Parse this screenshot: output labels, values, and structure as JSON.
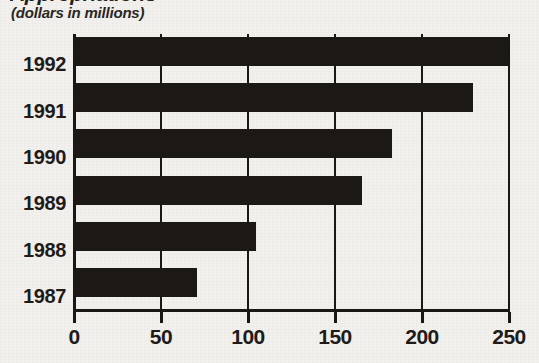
{
  "figure": {
    "title_cropped": "Appropriations",
    "subtitle": "(dollars in millions)"
  },
  "chart_data": {
    "type": "bar",
    "orientation": "horizontal",
    "title": "",
    "subtitle": "(dollars in millions)",
    "xlabel": "",
    "ylabel": "",
    "categories": [
      "1992",
      "1991",
      "1990",
      "1989",
      "1988",
      "1987"
    ],
    "values": [
      249,
      229,
      182,
      165,
      104,
      70
    ],
    "xlim": [
      0,
      250
    ],
    "ylim": null,
    "xticks": [
      0,
      50,
      100,
      150,
      200,
      250
    ],
    "xticklabels": [
      "0",
      "50",
      "100",
      "150",
      "200",
      "250"
    ],
    "grid": "vertical",
    "legend": null,
    "bar_color": "#1b1815",
    "background_color": "#f2f1ee",
    "units": "dollars in millions"
  },
  "axis": {
    "ticks": [
      {
        "label": "0",
        "value": 0
      },
      {
        "label": "50",
        "value": 50
      },
      {
        "label": "100",
        "value": 100
      },
      {
        "label": "150",
        "value": 150
      },
      {
        "label": "200",
        "value": 200
      },
      {
        "label": "250",
        "value": 250
      }
    ]
  },
  "bars": [
    {
      "category": "1992",
      "value": 249
    },
    {
      "category": "1991",
      "value": 229
    },
    {
      "category": "1990",
      "value": 182
    },
    {
      "category": "1989",
      "value": 165
    },
    {
      "category": "1988",
      "value": 104
    },
    {
      "category": "1987",
      "value": 70
    }
  ]
}
